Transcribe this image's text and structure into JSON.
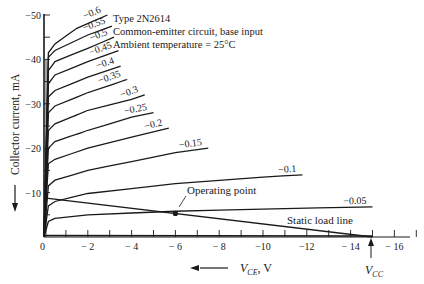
{
  "header": {
    "line1": "Type 2N2614",
    "line2": "Common-emitter circuit, base input",
    "line3": "Ambient temperature = 25°C"
  },
  "labels": {
    "ylabel": "Collector current, mA",
    "xlabel": "V",
    "xlabel_sub": "CE",
    "xlabel_unit": ", V",
    "vcc": "V",
    "vcc_sub": "CC",
    "operating_point": "Operating point",
    "load_line": "Static load line",
    "origin": "0"
  },
  "chart_data": {
    "type": "line",
    "xlabel": "V_CE, V",
    "ylabel": "Collector current, mA",
    "xlim": [
      0,
      -17
    ],
    "ylim": [
      0,
      -50
    ],
    "x_ticks": [
      0,
      -2,
      -4,
      -6,
      -8,
      -10,
      -12,
      -14,
      -16
    ],
    "x_tick_labels": [
      "0",
      "− 2",
      "− 4",
      "− 6",
      "− 8",
      "−10",
      "−12",
      "− 14",
      "− 16"
    ],
    "y_ticks": [
      -10,
      -20,
      -30,
      -40,
      -50
    ],
    "y_tick_labels": [
      "−10",
      "−20",
      "−30",
      "−40",
      "−50"
    ],
    "grid": false,
    "legend": "curve labels inline (base current, mA)",
    "series": [
      {
        "name": "−0.05",
        "x": [
          0,
          -0.2,
          -0.5,
          -2,
          -6,
          -10,
          -15
        ],
        "y": [
          0,
          -3.5,
          -4.2,
          -5.0,
          -5.8,
          -6.3,
          -6.8
        ]
      },
      {
        "name": "−0.1",
        "x": [
          0,
          -0.2,
          -0.5,
          -2,
          -6,
          -10,
          -11.8
        ],
        "y": [
          0,
          -7.0,
          -8.0,
          -9.8,
          -12.0,
          -13.5,
          -14.0
        ]
      },
      {
        "name": "−0.15",
        "x": [
          0,
          -0.2,
          -0.5,
          -2,
          -4,
          -6,
          -7.5
        ],
        "y": [
          0,
          -11.5,
          -12.8,
          -15.0,
          -17.0,
          -19.0,
          -20.0
        ]
      },
      {
        "name": "−0.2",
        "x": [
          0,
          -0.2,
          -0.5,
          -2,
          -4,
          -5.7
        ],
        "y": [
          0,
          -16.5,
          -17.5,
          -20.0,
          -22.5,
          -24.5
        ]
      },
      {
        "name": "−0.25",
        "x": [
          0,
          -0.2,
          -0.5,
          -2,
          -4,
          -5.0
        ],
        "y": [
          0,
          -20.0,
          -21.5,
          -24.0,
          -27.0,
          -28.0
        ]
      },
      {
        "name": "−0.3",
        "x": [
          0,
          -0.2,
          -0.5,
          -2,
          -4,
          -4.6
        ],
        "y": [
          0,
          -24.0,
          -25.5,
          -28.5,
          -31.0,
          -32.0
        ]
      },
      {
        "name": "−0.35",
        "x": [
          0,
          -0.2,
          -0.5,
          -2,
          -3.8
        ],
        "y": [
          0,
          -28.0,
          -29.5,
          -32.5,
          -35.5
        ]
      },
      {
        "name": "−0.4",
        "x": [
          0,
          -0.2,
          -0.5,
          -2,
          -3.5
        ],
        "y": [
          0,
          -31.5,
          -33.0,
          -36.0,
          -38.5
        ]
      },
      {
        "name": "−0.45",
        "x": [
          0,
          -0.2,
          -0.5,
          -2,
          -3.4
        ],
        "y": [
          0,
          -34.5,
          -36.5,
          -39.5,
          -42.0
        ]
      },
      {
        "name": "−0.5",
        "x": [
          0,
          -0.2,
          -0.5,
          -2,
          -3.2
        ],
        "y": [
          0,
          -37.5,
          -39.5,
          -42.5,
          -45.0
        ]
      },
      {
        "name": "−0.55",
        "x": [
          0,
          -0.2,
          -0.5,
          -2,
          -3.1
        ],
        "y": [
          0,
          -40.5,
          -42.0,
          -45.5,
          -47.5
        ]
      },
      {
        "name": "−0.6",
        "x": [
          0,
          -0.2,
          -0.5,
          -1.5,
          -2.9
        ],
        "y": [
          0,
          -41.5,
          -43.5,
          -47.0,
          -50.0
        ]
      }
    ],
    "load_line": {
      "x": [
        0,
        -15
      ],
      "y": [
        -8.8,
        0
      ],
      "label": "Static load line"
    },
    "operating_point": {
      "x": -6,
      "y": -5.3,
      "label": "Operating point"
    },
    "vcc": {
      "x": -15,
      "label": "V_CC"
    }
  }
}
